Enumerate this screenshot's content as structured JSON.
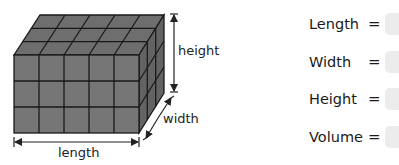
{
  "diagram": {
    "grid": {
      "length_units": 5,
      "width_units": 3,
      "height_units": 3
    },
    "labels": {
      "length": "length",
      "width": "width",
      "height": "height"
    },
    "colors": {
      "front": "#757575",
      "top": "#6c6c6c",
      "side": "#656565",
      "lines": "#1a1a1a"
    }
  },
  "form": {
    "rows": [
      {
        "label": "Length",
        "equals": "=",
        "value": ""
      },
      {
        "label": "Width",
        "equals": "=",
        "value": ""
      },
      {
        "label": "Height",
        "equals": "=",
        "value": ""
      },
      {
        "label": "Volume",
        "equals": "=",
        "value": ""
      }
    ]
  }
}
